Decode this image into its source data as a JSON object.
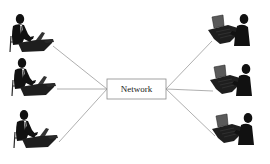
{
  "diagram": {
    "type": "network-topology",
    "center_node": {
      "label": "Network",
      "box": {
        "x": 107,
        "y": 79,
        "w": 59,
        "h": 20
      },
      "left_anchor": {
        "x": 107,
        "y": 89
      },
      "right_anchor": {
        "x": 166,
        "y": 89
      }
    },
    "colors": {
      "background": "#ffffff",
      "line": "#9a9a9a",
      "box_border": "#8a8a8a",
      "silhouette": "#111111",
      "desk": "#1e1e1e",
      "screen": "#5a5a5a"
    },
    "left_users": [
      {
        "id": "left-user-1",
        "x": 8,
        "y": 14,
        "line_from": {
          "x": 53,
          "y": 46
        }
      },
      {
        "id": "left-user-2",
        "x": 8,
        "y": 62,
        "line_from": {
          "x": 57,
          "y": 89
        }
      },
      {
        "id": "left-user-3",
        "x": 8,
        "y": 112,
        "line_from": {
          "x": 59,
          "y": 142
        }
      }
    ],
    "right_users": [
      {
        "id": "right-user-1",
        "x": 206,
        "y": 12,
        "line_to": {
          "x": 212,
          "y": 41
        }
      },
      {
        "id": "right-user-2",
        "x": 206,
        "y": 62,
        "line_to": {
          "x": 213,
          "y": 91
        }
      },
      {
        "id": "right-user-3",
        "x": 208,
        "y": 112,
        "line_to": {
          "x": 215,
          "y": 136
        }
      }
    ]
  }
}
